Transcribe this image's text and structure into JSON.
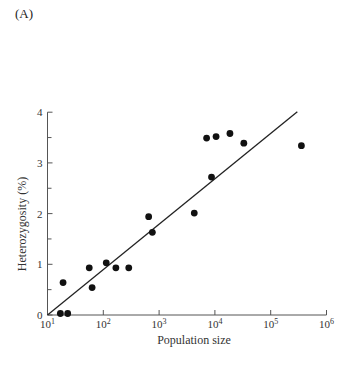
{
  "panel_label": "(A)",
  "chart_data": {
    "type": "scatter",
    "title": "",
    "xlabel": "Population size",
    "ylabel": "Heterozygosity (%)",
    "xscale": "log",
    "xlim": [
      10,
      1000000
    ],
    "ylim": [
      0,
      4
    ],
    "x_ticks": [
      {
        "exp": 1,
        "base": "10",
        "sup": "1"
      },
      {
        "exp": 2,
        "base": "10",
        "sup": "2"
      },
      {
        "exp": 3,
        "base": "10",
        "sup": "3"
      },
      {
        "exp": 4,
        "base": "10",
        "sup": "4"
      },
      {
        "exp": 5,
        "base": "10",
        "sup": "5"
      },
      {
        "exp": 6,
        "base": "10",
        "sup": "6"
      }
    ],
    "y_ticks": [
      0,
      1,
      2,
      3,
      4
    ],
    "y_minor_ticks": [
      0.5,
      1.5,
      2.5,
      3.5
    ],
    "grid": false,
    "legend": null,
    "series": [
      {
        "name": "Populations",
        "marker": "filled-circle",
        "points": [
          {
            "x": 17,
            "y": 0.03
          },
          {
            "x": 23,
            "y": 0.03
          },
          {
            "x": 19,
            "y": 0.64
          },
          {
            "x": 56,
            "y": 0.93
          },
          {
            "x": 63,
            "y": 0.54
          },
          {
            "x": 113,
            "y": 1.03
          },
          {
            "x": 168,
            "y": 0.93
          },
          {
            "x": 286,
            "y": 0.93
          },
          {
            "x": 650,
            "y": 1.94
          },
          {
            "x": 757,
            "y": 1.63
          },
          {
            "x": 4270,
            "y": 2.01
          },
          {
            "x": 7100,
            "y": 3.49
          },
          {
            "x": 8700,
            "y": 2.72
          },
          {
            "x": 10500,
            "y": 3.52
          },
          {
            "x": 18600,
            "y": 3.58
          },
          {
            "x": 33000,
            "y": 3.39
          },
          {
            "x": 355000,
            "y": 3.34
          }
        ]
      }
    ],
    "fit_line": {
      "type": "log-linear regression",
      "from": {
        "x": 10,
        "y": 0
      },
      "to": {
        "x": 300000,
        "y": 4.01
      }
    }
  }
}
